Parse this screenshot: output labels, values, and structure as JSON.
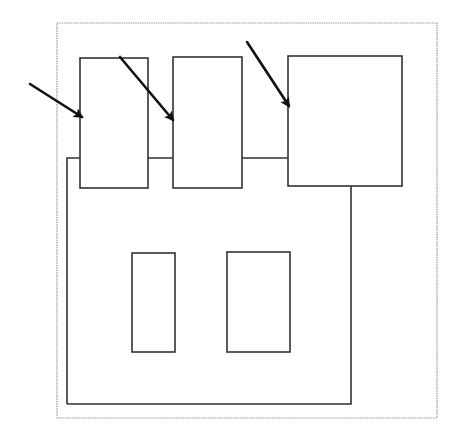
{
  "diagram": {
    "type": "block-layout-schematic",
    "width": 460,
    "height": 428,
    "colors": {
      "background": "#ffffff",
      "outer_frame": "#9a9a9a",
      "stroke": "#333333",
      "arrow": "#111111"
    },
    "outer_frame": {
      "x": 57,
      "y": 23,
      "w": 380,
      "h": 395
    },
    "main_body_outline": {
      "points": "67,404 67,158 80,158 M148,158 173,158 M242,158 288,158 M351,186 351,404 67,404"
    },
    "top_blocks": [
      {
        "id": "block-1",
        "x": 80,
        "y": 58,
        "w": 68,
        "h": 130
      },
      {
        "id": "block-2",
        "x": 173,
        "y": 57,
        "w": 69,
        "h": 131
      },
      {
        "id": "block-3",
        "x": 288,
        "y": 56,
        "w": 114,
        "h": 130
      }
    ],
    "inner_blocks": [
      {
        "id": "inner-a",
        "x": 132,
        "y": 253,
        "w": 43,
        "h": 99
      },
      {
        "id": "inner-b",
        "x": 227,
        "y": 252,
        "w": 63,
        "h": 100
      }
    ],
    "arrows": [
      {
        "id": "arrow-1",
        "x1": 30,
        "y1": 84,
        "x2": 82,
        "y2": 117
      },
      {
        "id": "arrow-2",
        "x1": 120,
        "y1": 57,
        "x2": 173,
        "y2": 120
      },
      {
        "id": "arrow-3",
        "x1": 247,
        "y1": 42,
        "x2": 289,
        "y2": 106
      }
    ]
  }
}
